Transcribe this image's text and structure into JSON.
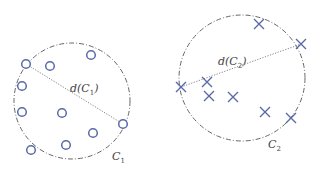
{
  "diagram": {
    "colors": {
      "point": "#5a6aa8",
      "boundary": "#666666",
      "diameter": "#777777",
      "label": "#444444"
    },
    "clusters": [
      {
        "name": "C1",
        "label": "C",
        "label_sub": "1",
        "diameter_label": "d(C",
        "diameter_label_sub": "1",
        "diameter_label_end": ")",
        "marker": "circle",
        "boundary": {
          "cx": 72,
          "cy": 101,
          "r": 58
        },
        "points": [
          [
            26,
            64
          ],
          [
            50,
            66
          ],
          [
            91,
            55
          ],
          [
            22,
            86
          ],
          [
            22,
            112
          ],
          [
            62,
            113
          ],
          [
            123,
            124
          ],
          [
            93,
            133
          ],
          [
            31,
            150
          ],
          [
            66,
            145
          ]
        ],
        "diameter_endpoints": [
          [
            26,
            64
          ],
          [
            123,
            124
          ]
        ],
        "label_pos": [
          112,
          160
        ],
        "diameter_label_pos": [
          70,
          92
        ]
      },
      {
        "name": "C2",
        "label": "C",
        "label_sub": "2",
        "diameter_label": "d(C",
        "diameter_label_sub": "2",
        "diameter_label_end": ")",
        "marker": "cross",
        "boundary": {
          "cx": 242,
          "cy": 78,
          "r": 63
        },
        "points": [
          [
            259,
            24
          ],
          [
            301,
            44
          ],
          [
            181,
            87
          ],
          [
            207,
            82
          ],
          [
            209,
            96
          ],
          [
            233,
            97
          ],
          [
            265,
            112
          ],
          [
            291,
            118
          ]
        ],
        "diameter_endpoints": [
          [
            181,
            87
          ],
          [
            301,
            44
          ]
        ],
        "label_pos": [
          268,
          148
        ],
        "diameter_label_pos": [
          218,
          65
        ]
      }
    ]
  }
}
